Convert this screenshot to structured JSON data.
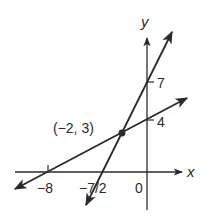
{
  "figure": {
    "type": "coordinate-graph",
    "axes": {
      "x_label": "x",
      "y_label": "y",
      "origin_label": "0"
    },
    "lines": [
      {
        "name": "steep-line",
        "slope": 2,
        "y_intercept": 7,
        "x_intercept": -3.5,
        "x_intercept_label": "−7/2",
        "y_intercept_label": "7"
      },
      {
        "name": "shallow-line",
        "slope": 0.5,
        "y_intercept": 4,
        "x_intercept": -8,
        "x_intercept_label": "−8",
        "y_intercept_label": "4"
      }
    ],
    "intersection": {
      "x": -2,
      "y": 3,
      "label": "(−2, 3)"
    },
    "colors": {
      "ink": "#2a2a2a",
      "background": "#ffffff"
    }
  }
}
